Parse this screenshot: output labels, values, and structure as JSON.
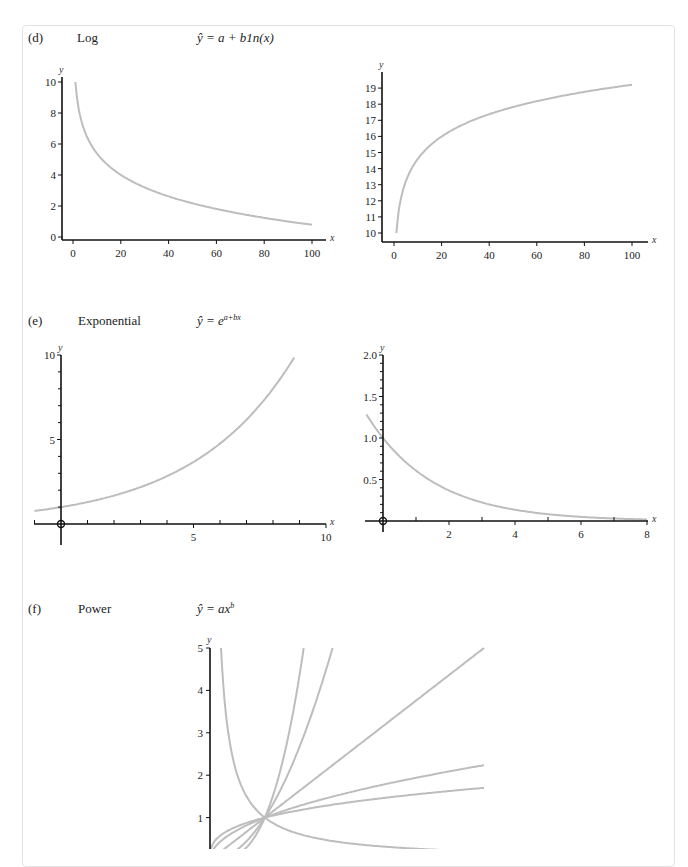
{
  "panels": [
    {
      "letter": "(d)",
      "name": "Log",
      "formula": "ŷ = a + b1n(x)"
    },
    {
      "letter": "(e)",
      "name": "Exponential",
      "formula_base": "ŷ = e",
      "formula_exp": "a+bx"
    },
    {
      "letter": "(f)",
      "name": "Power",
      "formula_base": "ŷ = ax",
      "formula_exp": "b"
    }
  ],
  "colors": {
    "curve": "#bdbdbd",
    "axis": "#111111",
    "border": "#e3e3e3"
  },
  "chart_data": [
    {
      "id": "d-left",
      "type": "line",
      "title": "Log (decreasing)",
      "xlabel": "x",
      "ylabel": "y",
      "xticks": [
        0,
        20,
        40,
        60,
        80,
        100
      ],
      "yticks": [
        0,
        2,
        4,
        6,
        8,
        10
      ],
      "xlim": [
        0,
        100
      ],
      "ylim": [
        0,
        10
      ],
      "x": [
        1,
        5,
        10,
        20,
        40,
        60,
        80,
        100
      ],
      "series": [
        {
          "name": "y = 10 - 2.0 ln(x)",
          "values": [
            10,
            6.8,
            5.4,
            4.0,
            2.6,
            1.8,
            1.2,
            0.8
          ]
        }
      ]
    },
    {
      "id": "d-right",
      "type": "line",
      "title": "Log (increasing)",
      "xlabel": "x",
      "ylabel": "y",
      "xticks": [
        0,
        20,
        40,
        60,
        80,
        100
      ],
      "yticks": [
        10,
        11,
        12,
        13,
        14,
        15,
        16,
        17,
        18,
        19
      ],
      "xlim": [
        0,
        100
      ],
      "ylim": [
        10,
        19
      ],
      "x": [
        1,
        2,
        5,
        10,
        20,
        40,
        60,
        80,
        100
      ],
      "series": [
        {
          "name": "y = 10 + 2 ln(x)",
          "values": [
            10,
            11.4,
            13.2,
            14.6,
            16.0,
            17.4,
            18.2,
            18.8,
            19.2
          ]
        }
      ]
    },
    {
      "id": "e-left",
      "type": "line",
      "title": "Exponential (growth)",
      "xlabel": "x",
      "ylabel": "y",
      "xticks": [
        5,
        10
      ],
      "yticks": [
        5,
        10
      ],
      "xlim": [
        -1,
        10
      ],
      "ylim": [
        -0.6,
        10
      ],
      "x": [
        -1,
        0,
        2,
        4,
        5,
        6,
        8,
        8.8
      ],
      "series": [
        {
          "name": "y = e^(0.26x)",
          "values": [
            0.77,
            1.0,
            1.7,
            2.8,
            3.7,
            4.8,
            8.0,
            10.0
          ]
        }
      ]
    },
    {
      "id": "e-right",
      "type": "line",
      "title": "Exponential (decay)",
      "xlabel": "x",
      "ylabel": "y",
      "xticks": [
        2,
        4,
        6,
        8
      ],
      "yticks": [
        0.5,
        1.0,
        1.5,
        2.0
      ],
      "xlim": [
        -0.5,
        8
      ],
      "ylim": [
        -0.1,
        2.0
      ],
      "x": [
        -0.5,
        0,
        1,
        2,
        3,
        4,
        6,
        8
      ],
      "series": [
        {
          "name": "y = e^(-0.5x)",
          "values": [
            1.28,
            1.0,
            0.61,
            0.37,
            0.22,
            0.14,
            0.05,
            0.02
          ]
        }
      ]
    },
    {
      "id": "f",
      "type": "line",
      "title": "Power",
      "xlabel": "",
      "ylabel": "y",
      "yticks": [
        1,
        2,
        3,
        4,
        5
      ],
      "xlim": [
        0,
        5
      ],
      "ylim": [
        0,
        5
      ],
      "series": [
        {
          "name": "b = 3",
          "exponent": 3
        },
        {
          "name": "b = 2",
          "exponent": 2
        },
        {
          "name": "b = 1",
          "exponent": 1
        },
        {
          "name": "b = 0.5",
          "exponent": 0.5
        },
        {
          "name": "b = 0.33",
          "exponent": 0.33
        },
        {
          "name": "b = -1",
          "exponent": -1
        }
      ]
    }
  ]
}
